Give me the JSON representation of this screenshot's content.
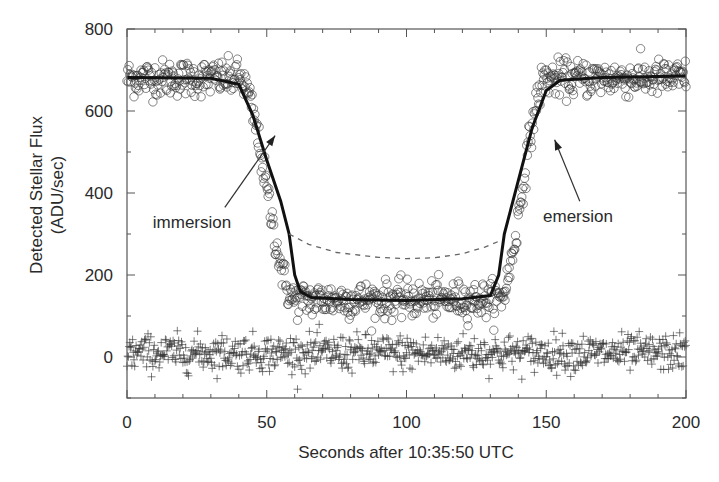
{
  "chart_data": {
    "type": "scatter",
    "title": "",
    "xlabel": "Seconds after 10:35:50 UTC",
    "ylabel_line1": "Detected Stellar Flux",
    "ylabel_line2": "(ADU/sec)",
    "xlim": [
      0,
      200
    ],
    "ylim": [
      -100,
      800
    ],
    "x_ticks": [
      0,
      50,
      100,
      150,
      200
    ],
    "x_tick_labels": [
      "0",
      "50",
      "100",
      "150",
      "200"
    ],
    "x_minor_step": 10,
    "y_ticks": [
      0,
      200,
      400,
      600,
      800
    ],
    "y_tick_labels": [
      "0",
      "200",
      "400",
      "600",
      "800"
    ],
    "y_minor_step": 100,
    "grid": false,
    "legend": "none",
    "series": [
      {
        "name": "observed flux",
        "marker": "open-circle",
        "model": {
          "baseline": 680,
          "floor": 140,
          "immersion_start": 40,
          "immersion_end": 60,
          "emersion_start": 133,
          "emersion_end": 150,
          "noise": 22
        },
        "sample_step": 0.25
      },
      {
        "name": "residuals",
        "marker": "plus",
        "model": {
          "baseline": 10,
          "noise": 22
        },
        "sample_step": 0.25
      },
      {
        "name": "fit",
        "style": "solid-line",
        "points": [
          [
            0,
            682
          ],
          [
            30,
            680
          ],
          [
            40,
            665
          ],
          [
            45,
            590
          ],
          [
            50,
            480
          ],
          [
            55,
            380
          ],
          [
            58,
            300
          ],
          [
            60,
            200
          ],
          [
            62,
            160
          ],
          [
            66,
            145
          ],
          [
            80,
            140
          ],
          [
            100,
            138
          ],
          [
            120,
            142
          ],
          [
            130,
            150
          ],
          [
            133,
            200
          ],
          [
            135,
            300
          ],
          [
            140,
            430
          ],
          [
            145,
            560
          ],
          [
            150,
            650
          ],
          [
            155,
            675
          ],
          [
            170,
            682
          ],
          [
            200,
            685
          ]
        ]
      },
      {
        "name": "no-atmosphere model",
        "style": "dashed-line",
        "points": [
          [
            58,
            300
          ],
          [
            65,
            275
          ],
          [
            75,
            255
          ],
          [
            90,
            243
          ],
          [
            100,
            240
          ],
          [
            110,
            242
          ],
          [
            120,
            252
          ],
          [
            128,
            268
          ],
          [
            134,
            285
          ]
        ]
      }
    ],
    "annotations": [
      {
        "text": "immersion",
        "arrow_from": [
          35,
          365
        ],
        "arrow_to": [
          53,
          540
        ]
      },
      {
        "text": "emersion",
        "arrow_from": [
          162,
          380
        ],
        "arrow_to": [
          153,
          530
        ]
      }
    ]
  }
}
